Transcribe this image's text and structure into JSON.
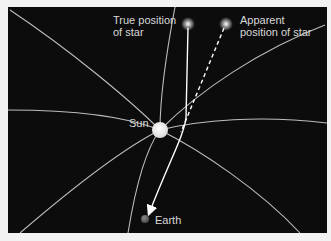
{
  "diagram": {
    "labels": {
      "true_star": "True position\nof star",
      "apparent_star": "Apparent\nposition of star",
      "sun": "Sun",
      "earth": "Earth"
    },
    "colors": {
      "background": "#0c0c0c",
      "field_lines": "#bdbdbd",
      "light_path": "#ffffff",
      "sun": "#f4f4f4",
      "earth": "#6a6a6a",
      "text": "#d8d8d8"
    },
    "elements": [
      {
        "id": "true-star",
        "x": 188,
        "y": 24
      },
      {
        "id": "apparent-star",
        "x": 226,
        "y": 24
      },
      {
        "id": "sun",
        "x": 160,
        "y": 130
      },
      {
        "id": "earth",
        "x": 145,
        "y": 219
      }
    ]
  }
}
